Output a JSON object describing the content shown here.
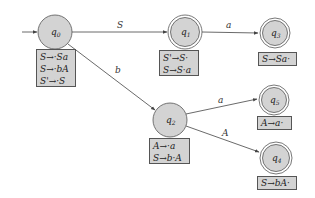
{
  "diagram": {
    "type": "LR(0) automaton",
    "colors": {
      "state_fill": "#d3d3d3",
      "stroke": "#555555",
      "box_fill": "#d3d3d3"
    },
    "states": [
      {
        "id": "q0",
        "label": "q0",
        "accepting": false,
        "start": true,
        "items": [
          "S→·Sa",
          "S→·bA",
          "S'→·S"
        ]
      },
      {
        "id": "q1",
        "label": "q1",
        "accepting": true,
        "items": [
          "S'→S·",
          "S→S·a"
        ]
      },
      {
        "id": "q3",
        "label": "q3",
        "accepting": true,
        "items": [
          "S→Sa·"
        ]
      },
      {
        "id": "q2",
        "label": "q2",
        "accepting": false,
        "items": [
          "A→·a",
          "S→b·A"
        ]
      },
      {
        "id": "q5",
        "label": "q5",
        "accepting": true,
        "items": [
          "A→a·"
        ]
      },
      {
        "id": "q4",
        "label": "q4",
        "accepting": true,
        "items": [
          "S→bA·"
        ]
      }
    ],
    "edges": [
      {
        "from": "q0",
        "to": "q1",
        "label": "S"
      },
      {
        "from": "q1",
        "to": "q3",
        "label": "a"
      },
      {
        "from": "q0",
        "to": "q2",
        "label": "b"
      },
      {
        "from": "q2",
        "to": "q5",
        "label": "a"
      },
      {
        "from": "q2",
        "to": "q4",
        "label": "A"
      }
    ]
  }
}
